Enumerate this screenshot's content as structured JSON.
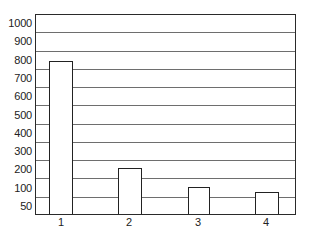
{
  "chart_data": {
    "type": "bar",
    "title": "",
    "xlabel": "",
    "ylabel": "",
    "categories": [
      "1",
      "2",
      "3",
      "4"
    ],
    "values": [
      800,
      210,
      110,
      90
    ],
    "y_tick_labels": [
      "1000",
      "900",
      "800",
      "700",
      "600",
      "500",
      "400",
      "300",
      "200",
      "100",
      "50"
    ],
    "ylim": [
      0,
      1050
    ],
    "grid": true,
    "legend": null
  },
  "colors": {
    "border": "#2a2a2a",
    "gridline": "#6e6e6e",
    "bar_fill": "#ffffff",
    "bar_edge": "#222222",
    "text": "#222222",
    "background": "#ffffff"
  }
}
